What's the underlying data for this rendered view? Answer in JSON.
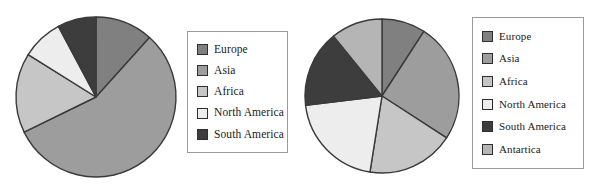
{
  "figure": {
    "background": "#ffffff",
    "outline_color": "#3a3a3a"
  },
  "palette": {
    "europe": "#808080",
    "asia": "#9d9d9d",
    "africa": "#c6c6c6",
    "north_america": "#ededed",
    "south_america": "#3d3d3d",
    "antartica": "#b5b5b5"
  },
  "chart_data": [
    {
      "type": "pie",
      "title": "",
      "id": "pie-chart-1",
      "legend_position": "right",
      "start_angle": 0,
      "direction": "clockwise",
      "categories": [
        "Europe",
        "Asia",
        "Africa",
        "North America",
        "South America"
      ],
      "values": [
        11.7,
        56.1,
        16.1,
        8.3,
        7.8
      ],
      "angles_deg": [
        42,
        202,
        58,
        30,
        28
      ],
      "colors": [
        "#808080",
        "#9d9d9d",
        "#c6c6c6",
        "#ededed",
        "#3d3d3d"
      ],
      "legend": [
        {
          "label": "Europe",
          "color": "#808080"
        },
        {
          "label": "Asia",
          "color": "#9d9d9d"
        },
        {
          "label": "Africa",
          "color": "#c6c6c6"
        },
        {
          "label": "North America",
          "color": "#ededed"
        },
        {
          "label": "South America",
          "color": "#3d3d3d"
        }
      ]
    },
    {
      "type": "pie",
      "title": "",
      "id": "pie-chart-2",
      "legend_position": "right",
      "start_angle": 0,
      "direction": "clockwise",
      "categories": [
        "Europe",
        "Asia",
        "Africa",
        "North America",
        "South America",
        "Antartica"
      ],
      "values": [
        9.2,
        25.0,
        18.3,
        20.6,
        16.1,
        10.8
      ],
      "angles_deg": [
        33,
        90,
        66,
        74,
        58,
        39
      ],
      "colors": [
        "#808080",
        "#9d9d9d",
        "#c6c6c6",
        "#ededed",
        "#3d3d3d",
        "#b5b5b5"
      ],
      "legend": [
        {
          "label": "Europe",
          "color": "#808080"
        },
        {
          "label": "Asia",
          "color": "#9d9d9d"
        },
        {
          "label": "Africa",
          "color": "#c6c6c6"
        },
        {
          "label": "North America",
          "color": "#ededed"
        },
        {
          "label": "South America",
          "color": "#3d3d3d"
        },
        {
          "label": "Antartica",
          "color": "#b5b5b5"
        }
      ]
    }
  ]
}
